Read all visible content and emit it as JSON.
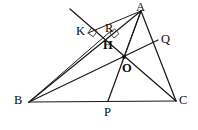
{
  "figure": {
    "kind": "euclidean-geometry-diagram",
    "background_color": "#ffffff",
    "stroke_color": "#1a1a1a",
    "canvas": {
      "width": 198,
      "height": 130
    }
  },
  "points": {
    "A": {
      "label": "A",
      "x": 141,
      "y": 11,
      "label_x": 136,
      "label_y": 1,
      "bold": false
    },
    "B": {
      "label": "B",
      "x": 29,
      "y": 102,
      "label_x": 14,
      "label_y": 94,
      "bold": false
    },
    "C": {
      "label": "C",
      "x": 176,
      "y": 101,
      "label_x": 179,
      "label_y": 94,
      "bold": false
    },
    "O": {
      "label": "O",
      "x": 124,
      "y": 57,
      "label_x": 122,
      "label_y": 62,
      "bold": true
    },
    "H": {
      "label": "H",
      "x": 111,
      "y": 42,
      "label_x": 103,
      "label_y": 39,
      "bold": true
    },
    "K": {
      "label": "K",
      "x": 88,
      "y": 33,
      "label_x": 76,
      "label_y": 25,
      "bold": false
    },
    "R": {
      "label": "R",
      "x": 112,
      "y": 30,
      "label_x": 105,
      "label_y": 22,
      "bold": false
    },
    "Q": {
      "label": "Q",
      "x": 158,
      "y": 40,
      "label_x": 161,
      "label_y": 33,
      "bold": false
    },
    "P": {
      "label": "P",
      "x": 108,
      "y": 101,
      "label_x": 104,
      "label_y": 106,
      "bold": false
    },
    "Lend": {
      "label": "",
      "x": 70,
      "y": 9,
      "label_x": 0,
      "label_y": 0,
      "bold": false
    }
  },
  "segments": [
    {
      "name": "side-BC",
      "from": "B",
      "to": "C",
      "weight": "main"
    },
    {
      "name": "side-AB-extended",
      "from": "A",
      "to": "B",
      "weight": "main"
    },
    {
      "name": "side-AC",
      "from": "A",
      "to": "C",
      "weight": "main"
    },
    {
      "name": "cevian-A-to-P",
      "from": "A",
      "to": "P",
      "weight": "main"
    },
    {
      "name": "cevian-B-to-Q",
      "from": "B",
      "to": "Q",
      "weight": "main"
    },
    {
      "name": "segment-A-to-K",
      "from": "A",
      "to": "K",
      "weight": "thin"
    },
    {
      "name": "oblique-line-through-K-to-C",
      "from": "Lend",
      "to": "C",
      "weight": "main"
    },
    {
      "name": "segment-B-to-R",
      "from": "B",
      "to": "R",
      "weight": "thin"
    },
    {
      "name": "segment-A-to-O-extended-to-B",
      "from": "A",
      "to": "O",
      "weight": "thin"
    }
  ],
  "right_angles": [
    {
      "name": "right-angle-at-K",
      "x": 88,
      "y": 33,
      "size": 6.5,
      "rotation": 35
    },
    {
      "name": "right-angle-at-H-R",
      "x": 114,
      "y": 38,
      "size": 6.5,
      "rotation": -40
    }
  ],
  "marked_dots": [
    {
      "name": "point-O-dot",
      "x": 124,
      "y": 57,
      "r": 2.1
    }
  ],
  "labels_order": [
    "A",
    "B",
    "C",
    "O",
    "H",
    "K",
    "R",
    "Q",
    "P"
  ]
}
